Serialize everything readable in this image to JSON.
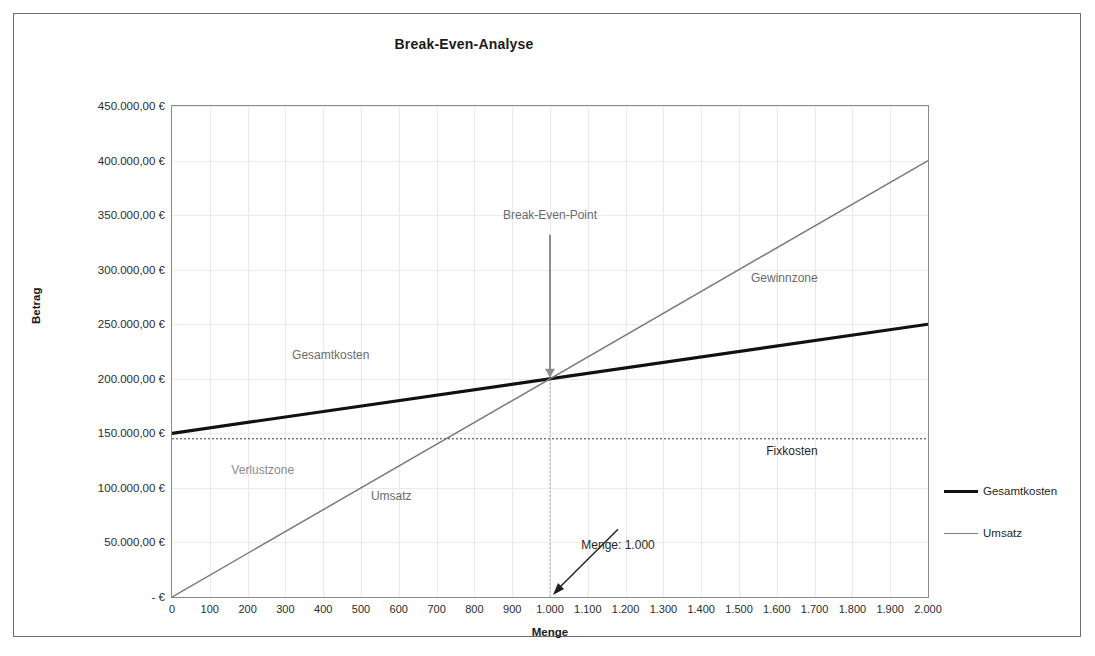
{
  "chart_data": {
    "type": "line",
    "title": "Break-Even-Analyse",
    "xlabel": "Menge",
    "ylabel": "Betrag",
    "xlim": [
      0,
      2000
    ],
    "ylim": [
      0,
      450000
    ],
    "grid": true,
    "legend_position": "right",
    "x": [
      0,
      2000
    ],
    "series": [
      {
        "name": "Gesamtkosten",
        "values": [
          150000,
          250000
        ],
        "color": "#111111",
        "width": 3.2
      },
      {
        "name": "Umsatz",
        "values": [
          0,
          400000
        ],
        "color": "#7a7a7a",
        "width": 1.5
      }
    ],
    "reference_lines": [
      {
        "name": "Fixkosten",
        "orientation": "horizontal",
        "value": 145000,
        "style": "dotted",
        "color": "#3a3a3a"
      },
      {
        "name": "Break-Even-Menge",
        "orientation": "vertical",
        "value": 1000,
        "style": "dotted",
        "color": "#9a9a9a"
      }
    ],
    "xticks": [
      "0",
      "100",
      "200",
      "300",
      "400",
      "500",
      "600",
      "700",
      "800",
      "900",
      "1.000",
      "1.100",
      "1.200",
      "1.300",
      "1.400",
      "1.500",
      "1.600",
      "1.700",
      "1.800",
      "1.900",
      "2.000"
    ],
    "xtick_values": [
      0,
      100,
      200,
      300,
      400,
      500,
      600,
      700,
      800,
      900,
      1000,
      1100,
      1200,
      1300,
      1400,
      1500,
      1600,
      1700,
      1800,
      1900,
      2000
    ],
    "yticks": [
      "-    €",
      "50.000,00 €",
      "100.000,00 €",
      "150.000,00 €",
      "200.000,00 €",
      "250.000,00 €",
      "300.000,00 €",
      "350.000,00 €",
      "400.000,00 €",
      "450.000,00 €"
    ],
    "ytick_values": [
      0,
      50000,
      100000,
      150000,
      200000,
      250000,
      300000,
      350000,
      400000,
      450000
    ],
    "break_even_point": {
      "menge": 1000,
      "betrag": 200000
    },
    "annotations": [
      {
        "name": "break-even-point",
        "text": "Break-Even-Point",
        "x": 1000,
        "y": 350000,
        "color": "#6b6b6b"
      },
      {
        "name": "gesamtkosten-series-label",
        "text": "Gesamtkosten",
        "x": 420,
        "y": 222000,
        "color": "#6b6b6b"
      },
      {
        "name": "umsatz-series-label",
        "text": "Umsatz",
        "x": 580,
        "y": 93000,
        "color": "#6b6b6b"
      },
      {
        "name": "gewinnzone",
        "text": "Gewinnzone",
        "x": 1620,
        "y": 292000,
        "color": "#6b6b6b"
      },
      {
        "name": "verlustzone",
        "text": "Verlustzone",
        "x": 240,
        "y": 116000,
        "color": "#8a8a8a"
      },
      {
        "name": "fixkosten",
        "text": "Fixkosten",
        "x": 1640,
        "y": 134000,
        "color": "#1f1f1f"
      },
      {
        "name": "menge-callout",
        "text": "Menge: 1.000",
        "x": 1180,
        "y": 48000,
        "color": "#1f1f1f"
      }
    ]
  },
  "legend": {
    "items": [
      {
        "label": "Gesamtkosten",
        "color": "#111111"
      },
      {
        "label": "Umsatz",
        "color": "#7a7a7a"
      }
    ]
  }
}
